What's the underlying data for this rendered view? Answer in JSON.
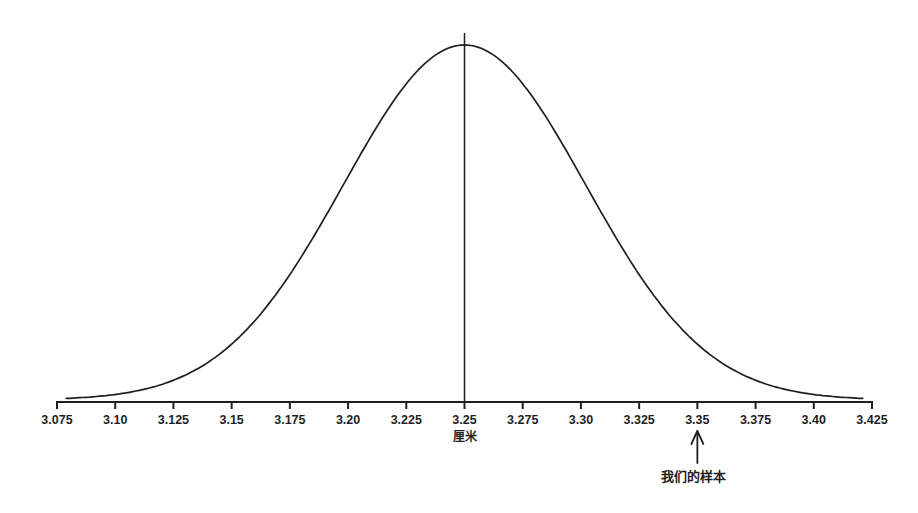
{
  "chart_data": {
    "type": "line",
    "title": "",
    "xlabel": "厘米",
    "ylabel": "",
    "xlim": [
      3.075,
      3.425
    ],
    "x_ticks": [
      3.075,
      3.1,
      3.125,
      3.15,
      3.175,
      3.2,
      3.225,
      3.25,
      3.275,
      3.3,
      3.325,
      3.35,
      3.375,
      3.4,
      3.425
    ],
    "x_tick_labels": [
      "3.075",
      "3.10",
      "3.125",
      "3.15",
      "3.175",
      "3.20",
      "3.225",
      "3.25",
      "3.275",
      "3.30",
      "3.325",
      "3.35",
      "3.375",
      "3.40",
      "3.425"
    ],
    "curve": {
      "distribution": "normal",
      "mean": 3.25,
      "sigma": 0.052,
      "draw_range": [
        3.079,
        3.421
      ]
    },
    "mean_line_x": 3.25,
    "annotation": {
      "label": "我们的样本",
      "x": 3.35,
      "arrow_direction": "up"
    },
    "grid": false,
    "y_axis_shown": false,
    "ink_color": "#1f1f1f",
    "background_color": "#ffffff"
  }
}
